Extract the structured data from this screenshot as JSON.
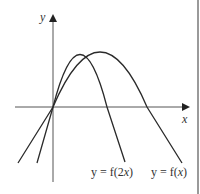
{
  "diagram": {
    "type": "function-transformation-graph",
    "axes": {
      "x_label": "x",
      "y_label": "y",
      "origin_px": [
        53,
        107
      ],
      "x_axis_px": [
        15,
        190
      ],
      "y_axis_px": [
        18,
        182
      ]
    },
    "curves": [
      {
        "name": "f-of-2x",
        "label_prefix": "y = f(2",
        "label_var": "x",
        "label_suffix": ")",
        "label": "y = f(2x)",
        "color": "#2a2a2a",
        "path": "M37,163 L53,107 Q80,2 107,107 L125,162"
      },
      {
        "name": "f-of-x",
        "label_prefix": "y = f(",
        "label_var": "x",
        "label_suffix": ")",
        "label": "y = f(x)",
        "color": "#2a2a2a",
        "path": "M18,163 L53,107 Q100,-3 147,107 L182,163"
      }
    ],
    "colors": {
      "axis": "#555555",
      "curve": "#2a2a2a",
      "border": "#9a9a9a",
      "background": "#ffffff"
    }
  }
}
